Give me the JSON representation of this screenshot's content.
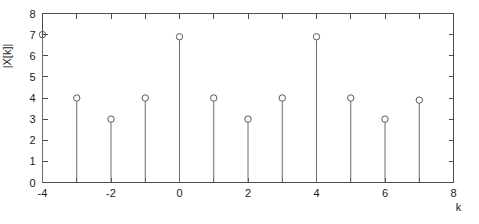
{
  "figure": {
    "background_color": "#ffffff",
    "axis_color": "#4d4d4d",
    "stem_color": "#6e6e6e",
    "marker_color": "#5a5a5a"
  },
  "chart_data": {
    "type": "scatter",
    "plot_style": "stem",
    "title": "",
    "xlabel": "k",
    "ylabel": "|X[k]|",
    "x": [
      -4,
      -3,
      -2,
      -1,
      0,
      1,
      2,
      3,
      4,
      5,
      6,
      7
    ],
    "values": [
      7,
      4,
      3,
      4,
      6.9,
      4,
      3,
      4,
      6.9,
      4,
      3,
      3.9
    ],
    "xlim": [
      -4,
      8
    ],
    "ylim": [
      0,
      8
    ],
    "xticks": [
      -4,
      -3,
      -2,
      -1,
      0,
      1,
      2,
      3,
      4,
      5,
      6,
      7,
      8
    ],
    "xtick_labels": [
      "-4",
      "",
      "-2",
      "",
      "0",
      "",
      "2",
      "",
      "4",
      "",
      "6",
      "",
      "8"
    ],
    "yticks": [
      0,
      1,
      2,
      3,
      4,
      5,
      6,
      7,
      8
    ],
    "ytick_labels": [
      "0",
      "1",
      "2",
      "3",
      "4",
      "5",
      "6",
      "7",
      "8"
    ],
    "grid": false,
    "legend": null,
    "marker": "circle-open",
    "baseline": 0
  }
}
